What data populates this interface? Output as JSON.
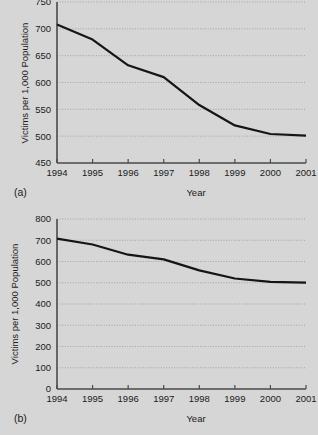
{
  "figure": {
    "background_color": "#d6d6d6",
    "line_color": "#151515",
    "grid_color": "#8f8f8f",
    "axis_color": "#4a4a4a"
  },
  "chart_data": [
    {
      "type": "line",
      "panel_label": "(a)",
      "title": "",
      "xlabel": "Year",
      "ylabel": "Victims per 1,000 Population",
      "x": [
        1994,
        1995,
        1996,
        1997,
        1998,
        1999,
        2000,
        2001
      ],
      "xticklabels": [
        "1994",
        "1995",
        "1996",
        "1997",
        "1998",
        "1999",
        "2000",
        "2001"
      ],
      "values": [
        708,
        680,
        632,
        610,
        558,
        520,
        504,
        501
      ],
      "yticks": [
        450,
        500,
        550,
        600,
        650,
        700,
        750
      ],
      "yticklabels": [
        "450",
        "500",
        "550",
        "600",
        "650",
        "700",
        "750"
      ],
      "ylim": [
        450,
        750
      ],
      "xlim": [
        1994,
        2001
      ],
      "grid": true,
      "legend": "none",
      "note": "truncated y-axis exaggerates the decline"
    },
    {
      "type": "line",
      "panel_label": "(b)",
      "title": "",
      "xlabel": "Year",
      "ylabel": "Victims per 1,000 Population",
      "x": [
        1994,
        1995,
        1996,
        1997,
        1998,
        1999,
        2000,
        2001
      ],
      "xticklabels": [
        "1994",
        "1995",
        "1996",
        "1997",
        "1998",
        "1999",
        "2000",
        "2001"
      ],
      "values": [
        708,
        680,
        632,
        610,
        558,
        520,
        504,
        501
      ],
      "yticks": [
        0,
        100,
        200,
        300,
        400,
        500,
        600,
        700,
        800
      ],
      "yticklabels": [
        "0",
        "100",
        "200",
        "300",
        "400",
        "500",
        "600",
        "700",
        "800"
      ],
      "ylim": [
        0,
        800
      ],
      "xlim": [
        1994,
        2001
      ],
      "grid": true,
      "legend": "none",
      "note": "full y-axis from zero shows a modest decline"
    }
  ]
}
